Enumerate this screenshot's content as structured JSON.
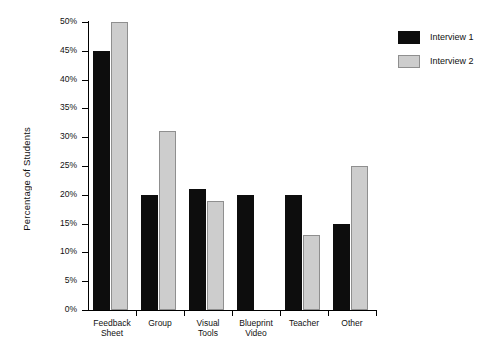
{
  "chart_data": {
    "type": "bar",
    "title": "",
    "subtitle": "",
    "xlabel": "",
    "ylabel": "Percentage of Students",
    "categories": [
      "Feedback\nSheet",
      "Group",
      "Visual\nTools",
      "Blueprint\nVideo",
      "Teacher",
      "Other"
    ],
    "series": [
      {
        "name": "Interview 1",
        "color": "#0d0d0d",
        "values": [
          45,
          20,
          21,
          20,
          20,
          15
        ]
      },
      {
        "name": "Interview 2",
        "color": "#cdcdcd",
        "values": [
          50,
          31,
          19,
          null,
          13,
          25
        ]
      }
    ],
    "ylim": [
      0,
      50
    ],
    "ytick_values": [
      0,
      5,
      10,
      15,
      20,
      25,
      30,
      35,
      40,
      45,
      50
    ],
    "ytick_labels": [
      "0%",
      "5%",
      "10%",
      "15%",
      "20%",
      "25%",
      "30%",
      "35%",
      "40%",
      "45%",
      "50%"
    ],
    "grid": false,
    "legend_position": "right",
    "legend_entries": [
      "Interview 1",
      "Interview 2"
    ]
  }
}
